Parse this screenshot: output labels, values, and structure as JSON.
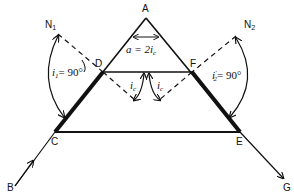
{
  "diagram": {
    "type": "prism-ray-diagram",
    "points": {
      "A": {
        "label": "A",
        "x": 146,
        "y": 18
      },
      "B": {
        "label": "B",
        "x": 15,
        "y": 186
      },
      "C": {
        "label": "C",
        "x": 55,
        "y": 132
      },
      "D": {
        "label": "D",
        "x": 103,
        "y": 72
      },
      "E": {
        "label": "E",
        "x": 240,
        "y": 132
      },
      "F": {
        "label": "F",
        "x": 192,
        "y": 72
      },
      "G": {
        "label": "G",
        "x": 283,
        "y": 178
      },
      "N1": {
        "label": "N",
        "sub": "1",
        "x": 58,
        "y": 34
      },
      "N2": {
        "label": "N",
        "sub": "2",
        "x": 236,
        "y": 36
      }
    },
    "annotations": {
      "apex_angle": {
        "text_pre": "a = 2",
        "symbol": "i",
        "sub": "c"
      },
      "i1": {
        "symbol": "i",
        "sub": "1",
        "value": "= 90°"
      },
      "i2": {
        "symbol": "i",
        "sub": "2",
        "prime": "′",
        "value": "= 90°"
      },
      "ic_left": {
        "symbol": "i",
        "sub": "c"
      },
      "ic_right": {
        "symbol": "i",
        "sub": "c"
      },
      "ic_D": {
        "symbol": "i",
        "sub": "c"
      }
    },
    "colors": {
      "stroke": "#111111",
      "background": "#ffffff"
    }
  }
}
